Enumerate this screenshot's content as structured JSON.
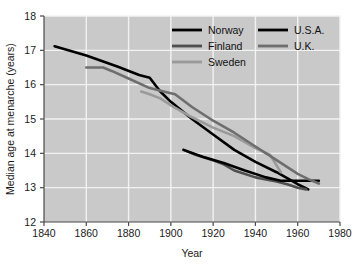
{
  "chart_data": {
    "type": "line",
    "title": "",
    "xlabel": "Year",
    "ylabel": "Median age at menarche (years)",
    "xlim": [
      1840,
      1980
    ],
    "ylim": [
      12,
      18
    ],
    "xticks": [
      1840,
      1860,
      1880,
      1900,
      1920,
      1940,
      1960,
      1980
    ],
    "yticks": [
      12,
      13,
      14,
      15,
      16,
      17,
      18
    ],
    "grid": true,
    "legend_position": "top-right",
    "plot_background": "#c9c9c9",
    "gridline_color": "#f2f2f2",
    "series": [
      {
        "name": "Norway",
        "color": "#000000",
        "width": 2.6,
        "x": [
          1845,
          1860,
          1875,
          1885,
          1890,
          1895,
          1900,
          1910,
          1920,
          1930,
          1940,
          1950,
          1960,
          1965
        ],
        "y": [
          17.12,
          16.85,
          16.52,
          16.28,
          16.2,
          15.8,
          15.5,
          15.0,
          14.55,
          14.1,
          13.75,
          13.45,
          13.1,
          12.95
        ]
      },
      {
        "name": "Finland",
        "color": "#4f4f4f",
        "width": 2.6,
        "x": [
          1906,
          1912,
          1920,
          1925,
          1930,
          1940,
          1950,
          1955,
          1960,
          1964
        ],
        "y": [
          14.1,
          13.95,
          13.8,
          13.68,
          13.5,
          13.3,
          13.18,
          13.1,
          13.0,
          12.95
        ]
      },
      {
        "name": "Sweden",
        "color": "#9a9a9a",
        "width": 2.6,
        "x": [
          1886,
          1890,
          1895,
          1900,
          1910,
          1920,
          1930,
          1940,
          1947,
          1952
        ],
        "y": [
          15.8,
          15.72,
          15.6,
          15.4,
          15.05,
          14.75,
          14.5,
          14.15,
          13.95,
          13.45
        ]
      },
      {
        "name": "U.S.A.",
        "color": "#000000",
        "width": 2.6,
        "x": [
          1906,
          1915,
          1925,
          1935,
          1945,
          1952,
          1960,
          1970
        ],
        "y": [
          14.1,
          13.9,
          13.72,
          13.5,
          13.3,
          13.2,
          13.2,
          13.2
        ]
      },
      {
        "name": "U.K.",
        "color": "#6e6e6e",
        "width": 2.6,
        "x": [
          1860,
          1868,
          1872,
          1880,
          1890,
          1898,
          1902,
          1910,
          1920,
          1930,
          1940,
          1950,
          1960,
          1965,
          1970
        ],
        "y": [
          16.5,
          16.5,
          16.4,
          16.18,
          15.9,
          15.78,
          15.72,
          15.35,
          14.95,
          14.6,
          14.2,
          13.8,
          13.4,
          13.25,
          13.12
        ]
      }
    ],
    "legend": [
      {
        "label": "Norway",
        "color": "#000000"
      },
      {
        "label": "U.S.A.",
        "color": "#000000"
      },
      {
        "label": "Finland",
        "color": "#4f4f4f"
      },
      {
        "label": "U.K.",
        "color": "#6e6e6e"
      },
      {
        "label": "Sweden",
        "color": "#9a9a9a"
      }
    ]
  }
}
